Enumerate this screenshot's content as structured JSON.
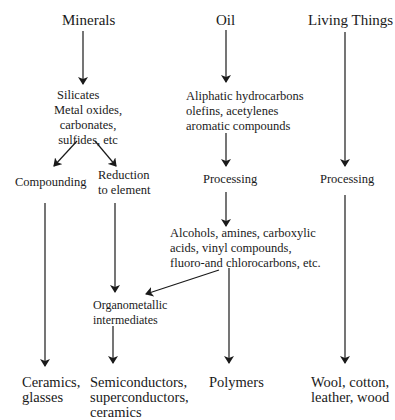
{
  "sources": {
    "minerals": "Minerals",
    "oil": "Oil",
    "living": "Living Things"
  },
  "intermediates": {
    "silicates": [
      "Silicates",
      "Metal oxides,",
      "carbonates,",
      "sulfides, etc"
    ],
    "aliphatic": [
      "Aliphatic hydrocarbons",
      "olefins, acetylenes",
      "aromatic compounds"
    ],
    "compounding": "Compounding",
    "reduction": [
      "Reduction",
      "to element"
    ],
    "processing_oil": "Processing",
    "processing_living": "Processing",
    "alcohols": [
      "Alcohols, amines, carboxylic",
      "acids, vinyl compounds,",
      "fluoro-and chlorocarbons, etc."
    ],
    "organometallic": [
      "Organometallic",
      "intermediates"
    ]
  },
  "products": {
    "ceramics": [
      "Ceramics,",
      "glasses"
    ],
    "semiconductors": [
      "Semiconductors,",
      "superconductors,",
      "ceramics"
    ],
    "polymers": "Polymers",
    "wool": [
      "Wool, cotton,",
      "leather, wood"
    ]
  },
  "colors": {
    "line": "#1a1a1a",
    "background": "#ffffff"
  }
}
